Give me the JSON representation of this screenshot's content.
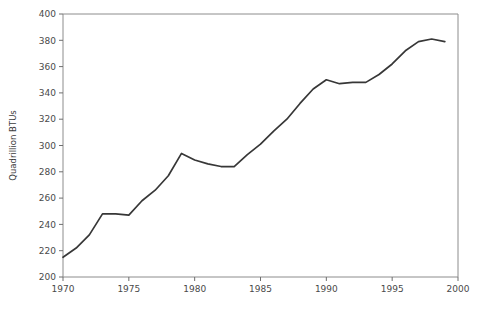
{
  "chart_data": {
    "type": "line",
    "title": "",
    "xlabel": "",
    "ylabel": "Quadrillion BTUs",
    "xlim": [
      1970,
      2000
    ],
    "ylim": [
      200,
      400
    ],
    "xticks": [
      1970,
      1975,
      1980,
      1985,
      1990,
      1995,
      2000
    ],
    "yticks": [
      200,
      220,
      240,
      260,
      280,
      300,
      320,
      340,
      360,
      380,
      400
    ],
    "grid": false,
    "legend": null,
    "line_color": "#373737",
    "axis_color": "#8c8c8c",
    "background_color": "#ffffff",
    "x": [
      1970,
      1971,
      1972,
      1973,
      1974,
      1975,
      1976,
      1977,
      1978,
      1979,
      1980,
      1981,
      1982,
      1983,
      1984,
      1985,
      1986,
      1987,
      1988,
      1989,
      1990,
      1991,
      1992,
      1993,
      1994,
      1995,
      1996,
      1997,
      1998,
      1999
    ],
    "values": [
      215,
      222,
      232,
      248,
      248,
      247,
      258,
      266,
      277,
      294,
      289,
      286,
      284,
      284,
      293,
      301,
      311,
      320,
      332,
      343,
      350,
      347,
      348,
      348,
      354,
      362,
      372,
      379,
      381,
      379
    ],
    "series": [
      {
        "name": "Energy consumption",
        "values": [
          215,
          222,
          232,
          248,
          248,
          247,
          258,
          266,
          277,
          294,
          289,
          286,
          284,
          284,
          293,
          301,
          311,
          320,
          332,
          343,
          350,
          347,
          348,
          348,
          354,
          362,
          372,
          379,
          381,
          379
        ]
      }
    ]
  },
  "plot": {
    "left": 63,
    "right": 458,
    "top": 14,
    "bottom": 277
  }
}
